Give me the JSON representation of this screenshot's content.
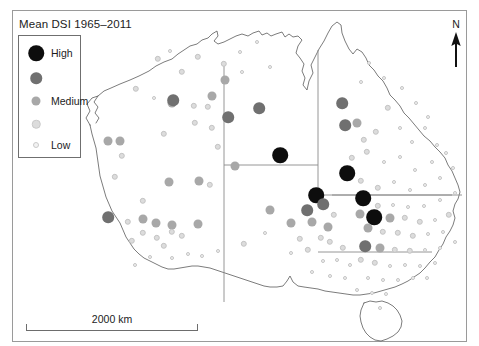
{
  "figure": {
    "title": "Mean DSI 1965–2011",
    "frame": {
      "x": 12,
      "y": 10,
      "w": 455,
      "h": 332,
      "border_color": "#9a9a9a"
    },
    "background": "#ffffff"
  },
  "legend": {
    "name": "mean-dsi-legend",
    "box": {
      "x": 18,
      "y": 35,
      "w": 63,
      "h": 123,
      "border_color": "#6f6f6f"
    },
    "items": [
      {
        "label": "High",
        "color": "#0d0d0d",
        "size": 15.5,
        "cy": 17,
        "labeled": true
      },
      {
        "label": "",
        "color": "#707070",
        "size": 11.5,
        "cy": 42,
        "labeled": false
      },
      {
        "label": "Medium",
        "color": "#a8a8a8",
        "size": 9.0,
        "cy": 65,
        "labeled": true
      },
      {
        "label": "",
        "color": "#dcdcdc",
        "size": 6.5,
        "cy": 88,
        "labeled": false
      },
      {
        "label": "Low",
        "color": "#f2f2f2",
        "size": 4.0,
        "cy": 109,
        "labeled": true
      }
    ],
    "dot_cx": 17,
    "label_x": 32
  },
  "north_arrow": {
    "label": "N",
    "name": "north-arrow"
  },
  "scale_bar": {
    "label": "2000 km",
    "length_px": 172,
    "x": 26,
    "y": 313
  },
  "chart_data": {
    "type": "scatter",
    "title": "Mean DSI 1965–2011",
    "subtitle": "",
    "xlabel": "",
    "ylabel": "",
    "map_region": "Australia",
    "legend_position": "top-left",
    "grid": false,
    "value_name": "Mean DSI",
    "classes": [
      {
        "label": "High",
        "color": "#0d0d0d",
        "radius": 7.8
      },
      {
        "label": "",
        "color": "#707070",
        "radius": 5.8
      },
      {
        "label": "Medium",
        "color": "#a8a8a8",
        "radius": 4.5
      },
      {
        "label": "",
        "color": "#dcdcdc",
        "radius": 3.2
      },
      {
        "label": "Low",
        "color": "#f2f2f2",
        "radius": 2.0
      }
    ],
    "scale_bar_km": 2000,
    "points": [
      {
        "x": 228,
        "y": 42,
        "c": 4
      },
      {
        "x": 245,
        "y": 32,
        "c": 4
      },
      {
        "x": 258,
        "y": 57,
        "c": 4
      },
      {
        "x": 230,
        "y": 62,
        "c": 4
      },
      {
        "x": 212,
        "y": 54,
        "c": 3
      },
      {
        "x": 213,
        "y": 70,
        "c": 2
      },
      {
        "x": 200,
        "y": 86,
        "c": 2
      },
      {
        "x": 216,
        "y": 107,
        "c": 1
      },
      {
        "x": 247,
        "y": 98,
        "c": 1
      },
      {
        "x": 268,
        "y": 145,
        "c": 0
      },
      {
        "x": 223,
        "y": 156,
        "c": 2
      },
      {
        "x": 206,
        "y": 137,
        "c": 3
      },
      {
        "x": 198,
        "y": 175,
        "c": 3
      },
      {
        "x": 146,
        "y": 49,
        "c": 3
      },
      {
        "x": 158,
        "y": 41,
        "c": 4
      },
      {
        "x": 170,
        "y": 62,
        "c": 3
      },
      {
        "x": 186,
        "y": 47,
        "c": 3
      },
      {
        "x": 124,
        "y": 79,
        "c": 3
      },
      {
        "x": 142,
        "y": 88,
        "c": 4
      },
      {
        "x": 160,
        "y": 93,
        "c": 2
      },
      {
        "x": 161,
        "y": 90,
        "c": 1
      },
      {
        "x": 182,
        "y": 96,
        "c": 3
      },
      {
        "x": 196,
        "y": 97,
        "c": 3
      },
      {
        "x": 200,
        "y": 118,
        "c": 3
      },
      {
        "x": 183,
        "y": 113,
        "c": 3
      },
      {
        "x": 152,
        "y": 124,
        "c": 3
      },
      {
        "x": 108,
        "y": 131,
        "c": 2
      },
      {
        "x": 96,
        "y": 131,
        "c": 2
      },
      {
        "x": 110,
        "y": 146,
        "c": 3
      },
      {
        "x": 157,
        "y": 172,
        "c": 2
      },
      {
        "x": 187,
        "y": 171,
        "c": 2
      },
      {
        "x": 103,
        "y": 167,
        "c": 3
      },
      {
        "x": 131,
        "y": 191,
        "c": 3
      },
      {
        "x": 96,
        "y": 207,
        "c": 1
      },
      {
        "x": 116,
        "y": 212,
        "c": 3
      },
      {
        "x": 131,
        "y": 209,
        "c": 2
      },
      {
        "x": 144,
        "y": 213,
        "c": 2
      },
      {
        "x": 160,
        "y": 215,
        "c": 2
      },
      {
        "x": 160,
        "y": 222,
        "c": 3
      },
      {
        "x": 145,
        "y": 228,
        "c": 3
      },
      {
        "x": 131,
        "y": 223,
        "c": 3
      },
      {
        "x": 120,
        "y": 231,
        "c": 3
      },
      {
        "x": 152,
        "y": 236,
        "c": 3
      },
      {
        "x": 170,
        "y": 226,
        "c": 3
      },
      {
        "x": 186,
        "y": 214,
        "c": 2
      },
      {
        "x": 160,
        "y": 248,
        "c": 4
      },
      {
        "x": 138,
        "y": 247,
        "c": 4
      },
      {
        "x": 176,
        "y": 244,
        "c": 4
      },
      {
        "x": 190,
        "y": 246,
        "c": 4
      },
      {
        "x": 206,
        "y": 241,
        "c": 4
      },
      {
        "x": 232,
        "y": 234,
        "c": 3
      },
      {
        "x": 253,
        "y": 223,
        "c": 4
      },
      {
        "x": 123,
        "y": 255,
        "c": 4
      },
      {
        "x": 258,
        "y": 200,
        "c": 2
      },
      {
        "x": 279,
        "y": 213,
        "c": 2
      },
      {
        "x": 295,
        "y": 200,
        "c": 1
      },
      {
        "x": 304,
        "y": 185,
        "c": 0
      },
      {
        "x": 311,
        "y": 194,
        "c": 1
      },
      {
        "x": 300,
        "y": 212,
        "c": 2
      },
      {
        "x": 316,
        "y": 217,
        "c": 2
      },
      {
        "x": 322,
        "y": 205,
        "c": 3
      },
      {
        "x": 309,
        "y": 228,
        "c": 3
      },
      {
        "x": 318,
        "y": 232,
        "c": 3
      },
      {
        "x": 331,
        "y": 238,
        "c": 3
      },
      {
        "x": 325,
        "y": 250,
        "c": 4
      },
      {
        "x": 311,
        "y": 251,
        "c": 4
      },
      {
        "x": 338,
        "y": 255,
        "c": 4
      },
      {
        "x": 296,
        "y": 240,
        "c": 3
      },
      {
        "x": 288,
        "y": 229,
        "c": 3
      },
      {
        "x": 279,
        "y": 243,
        "c": 4
      },
      {
        "x": 300,
        "y": 262,
        "c": 4
      },
      {
        "x": 318,
        "y": 266,
        "c": 4
      },
      {
        "x": 333,
        "y": 268,
        "c": 4
      },
      {
        "x": 330,
        "y": 93,
        "c": 1
      },
      {
        "x": 345,
        "y": 113,
        "c": 2
      },
      {
        "x": 333,
        "y": 115,
        "c": 1
      },
      {
        "x": 352,
        "y": 130,
        "c": 3
      },
      {
        "x": 364,
        "y": 122,
        "c": 3
      },
      {
        "x": 376,
        "y": 98,
        "c": 3
      },
      {
        "x": 388,
        "y": 118,
        "c": 4
      },
      {
        "x": 400,
        "y": 132,
        "c": 4
      },
      {
        "x": 413,
        "y": 118,
        "c": 4
      },
      {
        "x": 425,
        "y": 135,
        "c": 4
      },
      {
        "x": 404,
        "y": 93,
        "c": 4
      },
      {
        "x": 416,
        "y": 107,
        "c": 4
      },
      {
        "x": 390,
        "y": 78,
        "c": 4
      },
      {
        "x": 372,
        "y": 68,
        "c": 4
      },
      {
        "x": 357,
        "y": 53,
        "c": 4
      },
      {
        "x": 349,
        "y": 72,
        "c": 4
      },
      {
        "x": 340,
        "y": 148,
        "c": 3
      },
      {
        "x": 355,
        "y": 142,
        "c": 3
      },
      {
        "x": 372,
        "y": 152,
        "c": 4
      },
      {
        "x": 388,
        "y": 147,
        "c": 4
      },
      {
        "x": 403,
        "y": 160,
        "c": 4
      },
      {
        "x": 420,
        "y": 152,
        "c": 4
      },
      {
        "x": 434,
        "y": 143,
        "c": 4
      },
      {
        "x": 441,
        "y": 158,
        "c": 4
      },
      {
        "x": 428,
        "y": 168,
        "c": 4
      },
      {
        "x": 413,
        "y": 175,
        "c": 4
      },
      {
        "x": 398,
        "y": 180,
        "c": 4
      },
      {
        "x": 382,
        "y": 172,
        "c": 4
      },
      {
        "x": 366,
        "y": 178,
        "c": 3
      },
      {
        "x": 349,
        "y": 171,
        "c": 3
      },
      {
        "x": 335,
        "y": 163,
        "c": 0
      },
      {
        "x": 351,
        "y": 188,
        "c": 0
      },
      {
        "x": 366,
        "y": 196,
        "c": 3
      },
      {
        "x": 381,
        "y": 195,
        "c": 4
      },
      {
        "x": 396,
        "y": 197,
        "c": 4
      },
      {
        "x": 412,
        "y": 196,
        "c": 4
      },
      {
        "x": 428,
        "y": 190,
        "c": 4
      },
      {
        "x": 443,
        "y": 183,
        "c": 4
      },
      {
        "x": 437,
        "y": 205,
        "c": 3
      },
      {
        "x": 423,
        "y": 210,
        "c": 4
      },
      {
        "x": 408,
        "y": 212,
        "c": 3
      },
      {
        "x": 393,
        "y": 208,
        "c": 3
      },
      {
        "x": 378,
        "y": 208,
        "c": 2
      },
      {
        "x": 362,
        "y": 207,
        "c": 0
      },
      {
        "x": 348,
        "y": 204,
        "c": 2
      },
      {
        "x": 356,
        "y": 218,
        "c": 2
      },
      {
        "x": 371,
        "y": 222,
        "c": 3
      },
      {
        "x": 386,
        "y": 223,
        "c": 3
      },
      {
        "x": 401,
        "y": 226,
        "c": 3
      },
      {
        "x": 416,
        "y": 224,
        "c": 4
      },
      {
        "x": 431,
        "y": 222,
        "c": 4
      },
      {
        "x": 443,
        "y": 232,
        "c": 4
      },
      {
        "x": 428,
        "y": 238,
        "c": 4
      },
      {
        "x": 413,
        "y": 240,
        "c": 4
      },
      {
        "x": 398,
        "y": 241,
        "c": 3
      },
      {
        "x": 383,
        "y": 240,
        "c": 3
      },
      {
        "x": 368,
        "y": 238,
        "c": 2
      },
      {
        "x": 353,
        "y": 236,
        "c": 1
      },
      {
        "x": 349,
        "y": 250,
        "c": 3
      },
      {
        "x": 363,
        "y": 253,
        "c": 3
      },
      {
        "x": 378,
        "y": 256,
        "c": 4
      },
      {
        "x": 393,
        "y": 255,
        "c": 4
      },
      {
        "x": 408,
        "y": 256,
        "c": 4
      },
      {
        "x": 423,
        "y": 253,
        "c": 4
      },
      {
        "x": 356,
        "y": 268,
        "c": 4
      },
      {
        "x": 371,
        "y": 270,
        "c": 4
      },
      {
        "x": 386,
        "y": 270,
        "c": 4
      },
      {
        "x": 401,
        "y": 268,
        "c": 4
      },
      {
        "x": 415,
        "y": 268,
        "c": 4
      },
      {
        "x": 345,
        "y": 280,
        "c": 4
      },
      {
        "x": 360,
        "y": 283,
        "c": 4
      },
      {
        "x": 374,
        "y": 284,
        "c": 4
      },
      {
        "x": 368,
        "y": 298,
        "c": 4
      }
    ]
  }
}
